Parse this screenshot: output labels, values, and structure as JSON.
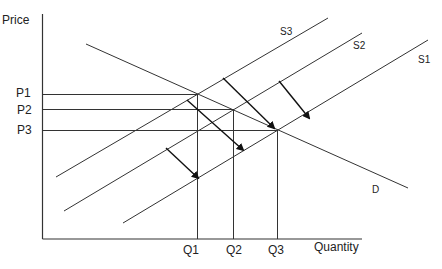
{
  "diagram": {
    "type": "supply-demand",
    "axes": {
      "y_label": "Price",
      "x_label": "Quantity"
    },
    "price_levels": [
      {
        "label": "P1",
        "y": 94
      },
      {
        "label": "P2",
        "y": 109
      },
      {
        "label": "P3",
        "y": 130
      }
    ],
    "quantity_levels": [
      {
        "label": "Q1",
        "x": 197
      },
      {
        "label": "Q2",
        "x": 233
      },
      {
        "label": "Q3",
        "x": 277
      }
    ],
    "curves": [
      {
        "label": "D",
        "kind": "demand",
        "from": [
          86,
          44
        ],
        "to": [
          408,
          188
        ]
      },
      {
        "label": "S3",
        "kind": "supply",
        "from": [
          56,
          177
        ],
        "to": [
          328,
          18
        ]
      },
      {
        "label": "S2",
        "kind": "supply",
        "from": [
          64,
          211
        ],
        "to": [
          362,
          33
        ]
      },
      {
        "label": "S1",
        "kind": "supply",
        "from": [
          123,
          223
        ],
        "to": [
          428,
          40
        ]
      }
    ],
    "shift_arrows": [
      {
        "from": [
          223,
          78
        ],
        "to": [
          274,
          128
        ]
      },
      {
        "from": [
          279,
          81
        ],
        "to": [
          309,
          118
        ]
      },
      {
        "from": [
          187,
          100
        ],
        "to": [
          243,
          150
        ]
      },
      {
        "from": [
          166,
          148
        ],
        "to": [
          198,
          178
        ]
      }
    ],
    "line_color": "#333333"
  }
}
